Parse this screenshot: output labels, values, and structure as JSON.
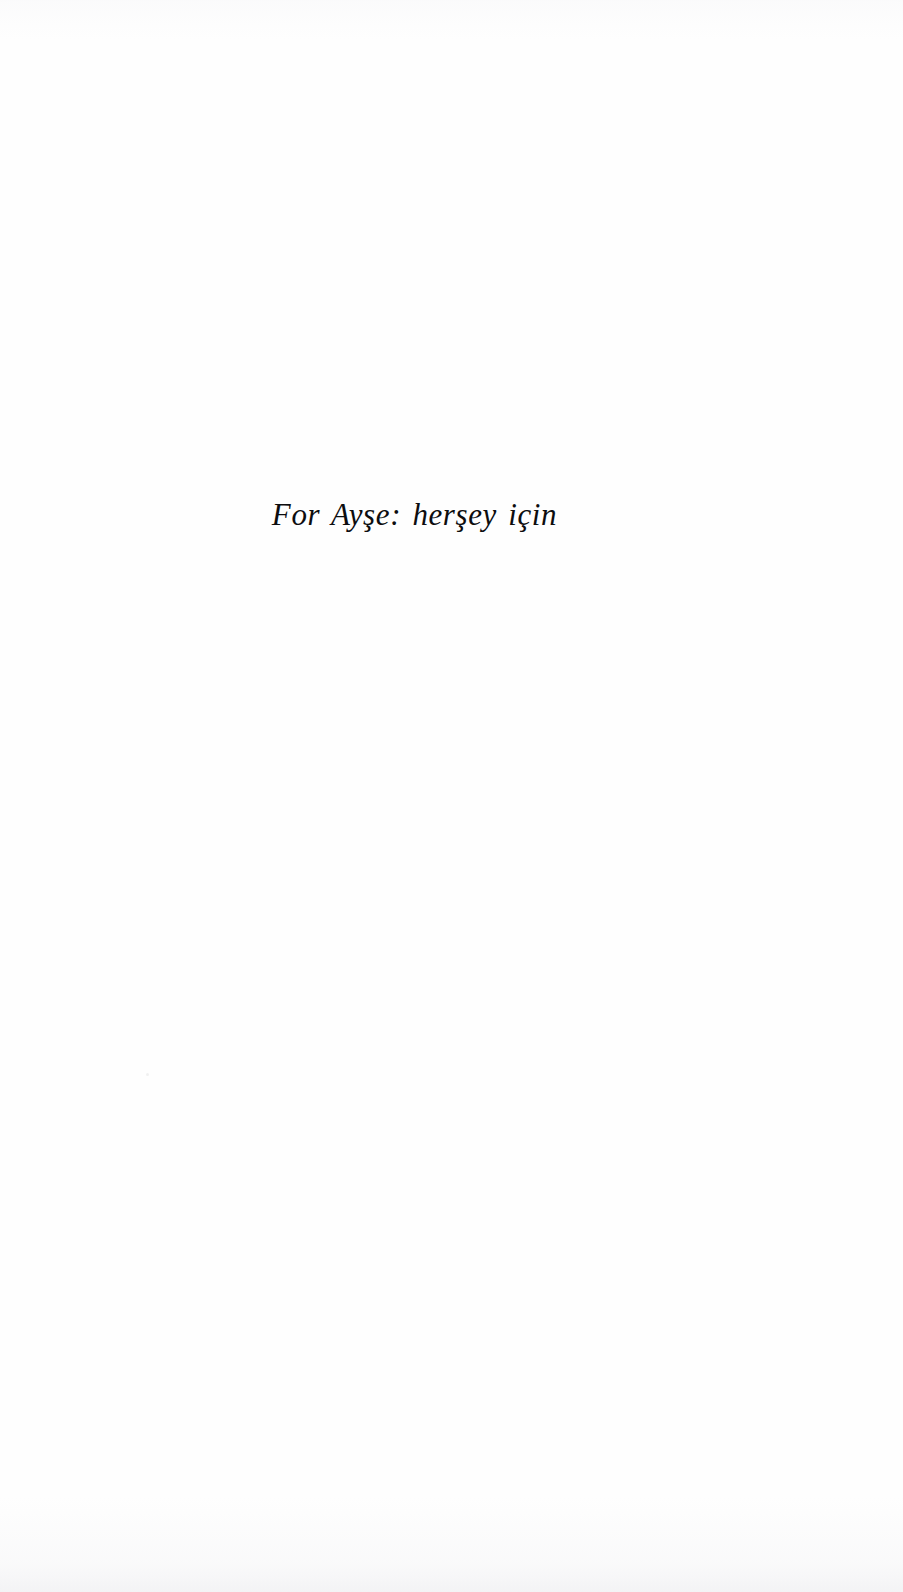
{
  "document": {
    "page_type": "dedication",
    "background_color": "#fefefe",
    "ink_color": "#0d0d0f"
  },
  "dedication": {
    "text": "For Ayşe: herşey için",
    "language_note": "English and Turkish",
    "alignment": "center",
    "style": "italic-serif"
  }
}
